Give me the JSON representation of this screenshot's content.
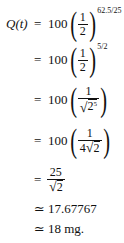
{
  "equation": {
    "lhs": "Q(t)",
    "steps": [
      {
        "relation": "=",
        "coefficient": "100",
        "numerator": "1",
        "denominator": "2",
        "exponent": "62.5/25"
      },
      {
        "relation": "=",
        "coefficient": "100",
        "numerator": "1",
        "denominator": "2",
        "exponent": "5/2"
      },
      {
        "relation": "=",
        "coefficient": "100",
        "numerator": "1",
        "denominator_radicand": "2",
        "denominator_radicand_exponent": "5"
      },
      {
        "relation": "=",
        "coefficient": "100",
        "numerator": "1",
        "denominator_prefix": "4",
        "denominator_radicand": "2"
      },
      {
        "relation": "=",
        "numerator": "25",
        "denominator_radicand": "2"
      },
      {
        "relation": "≃",
        "value": "17.67767"
      },
      {
        "relation": "≃",
        "value": "18 mg."
      }
    ]
  }
}
